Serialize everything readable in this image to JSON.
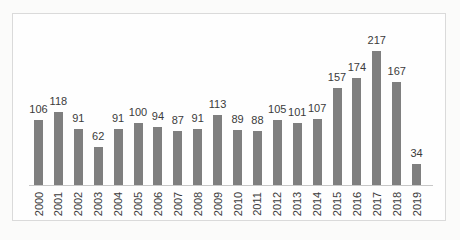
{
  "chart_data": {
    "type": "bar",
    "categories": [
      "2000",
      "2001",
      "2002",
      "2003",
      "2004",
      "2005",
      "2006",
      "2007",
      "2008",
      "2009",
      "2010",
      "2011",
      "2012",
      "2013",
      "2014",
      "2015",
      "2016",
      "2017",
      "2018",
      "2019"
    ],
    "values": [
      106,
      118,
      91,
      62,
      91,
      100,
      94,
      87,
      91,
      113,
      89,
      88,
      105,
      101,
      107,
      157,
      174,
      217,
      167,
      34
    ],
    "title": "",
    "xlabel": "",
    "ylabel": "",
    "ylim": [
      0,
      230
    ],
    "grid": false,
    "legend": false,
    "data_labels_shown": true,
    "bar_color": "#7f7f7f",
    "text_color": "#3b3b3b",
    "axis_line_color": "#c7c7c7",
    "frame_border_color": "#dadada"
  }
}
